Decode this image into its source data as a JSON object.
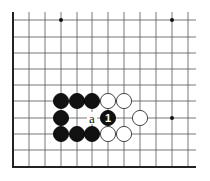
{
  "diagram": {
    "type": "go-board-fragment",
    "grid": {
      "columns_x": [
        13,
        29,
        45,
        61,
        77,
        92,
        108,
        124,
        140,
        156,
        172,
        188
      ],
      "rows_y": [
        20,
        37,
        53,
        69,
        85,
        101,
        118,
        134,
        150,
        167
      ],
      "right_extent": 196,
      "top_extent": 12,
      "left_border_thick": true,
      "bottom_border_thick": true
    },
    "star_points": [
      {
        "col": 3,
        "row": 0
      },
      {
        "col": 10,
        "row": 0
      },
      {
        "col": 10,
        "row": 6
      }
    ],
    "stones": [
      {
        "color": "black",
        "col": 3,
        "row": 5
      },
      {
        "color": "black",
        "col": 4,
        "row": 5
      },
      {
        "color": "black",
        "col": 5,
        "row": 5
      },
      {
        "color": "white",
        "col": 6,
        "row": 5
      },
      {
        "color": "white",
        "col": 7,
        "row": 5
      },
      {
        "color": "black",
        "col": 3,
        "row": 6
      },
      {
        "color": "black",
        "col": 6,
        "row": 6,
        "number": "1"
      },
      {
        "color": "white",
        "col": 8,
        "row": 6
      },
      {
        "color": "black",
        "col": 3,
        "row": 7
      },
      {
        "color": "black",
        "col": 4,
        "row": 7
      },
      {
        "color": "black",
        "col": 5,
        "row": 7
      },
      {
        "color": "white",
        "col": 6,
        "row": 7
      },
      {
        "color": "white",
        "col": 7,
        "row": 7
      }
    ],
    "labels": [
      {
        "text": "a",
        "col": 5,
        "row": 6
      }
    ],
    "colors": {
      "black_stone": "#111111",
      "white_stone": "#ffffff",
      "grid": "#555555",
      "background": "#ffffff"
    }
  }
}
